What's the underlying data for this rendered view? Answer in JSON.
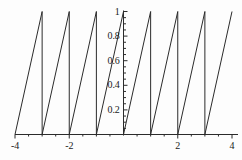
{
  "chart_data": {
    "type": "line",
    "title": "",
    "subtitle": "",
    "xlabel": "",
    "ylabel": "",
    "xlim": [
      -4,
      4
    ],
    "ylim": [
      0,
      1
    ],
    "grid": false,
    "legend": null,
    "x_tick_labels": [
      "-4",
      "-2",
      "2",
      "4"
    ],
    "x_tick_values": [
      -4,
      -2,
      2,
      4
    ],
    "x_minor_ticks": [
      -3.5,
      -3,
      -2.5,
      -1.5,
      -1,
      -0.5,
      0.5,
      1,
      1.5,
      2.5,
      3,
      3.5
    ],
    "y_tick_labels": [
      "0.2",
      "0.4",
      "0.6",
      "0.8",
      "1"
    ],
    "y_tick_values": [
      0.2,
      0.4,
      0.6,
      0.8,
      1
    ],
    "series": [
      {
        "name": "sawtooth",
        "color": "#2b2b2b",
        "period": 1,
        "segments": [
          {
            "x": [
              -4,
              -3
            ],
            "y": [
              0,
              1
            ]
          },
          {
            "x": [
              -3,
              -2
            ],
            "y": [
              0,
              1
            ]
          },
          {
            "x": [
              -2,
              -1
            ],
            "y": [
              0,
              1
            ]
          },
          {
            "x": [
              -1,
              0
            ],
            "y": [
              0,
              1
            ]
          },
          {
            "x": [
              0,
              1
            ],
            "y": [
              0,
              1
            ]
          },
          {
            "x": [
              1,
              2
            ],
            "y": [
              0,
              1
            ]
          },
          {
            "x": [
              2,
              3
            ],
            "y": [
              0,
              1
            ]
          },
          {
            "x": [
              3,
              4
            ],
            "y": [
              0,
              1
            ]
          }
        ],
        "drop_x": [
          -3,
          -2,
          -1,
          0,
          1,
          2,
          3
        ]
      }
    ],
    "axis_color": "#2b2b2b",
    "background": "#ffffff"
  },
  "axes": {
    "x_labels": [
      {
        "text": "-4",
        "value": -4
      },
      {
        "text": "-2",
        "value": -2
      },
      {
        "text": "2",
        "value": 2
      },
      {
        "text": "4",
        "value": 4
      }
    ],
    "y_labels": [
      {
        "text": "0.2",
        "value": 0.2
      },
      {
        "text": "0.4",
        "value": 0.4
      },
      {
        "text": "0.6",
        "value": 0.6
      },
      {
        "text": "0.8",
        "value": 0.8
      },
      {
        "text": "1",
        "value": 1
      }
    ]
  }
}
